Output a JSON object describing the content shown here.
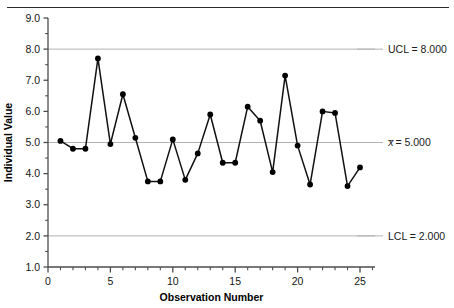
{
  "chart_data": {
    "type": "line",
    "title": "",
    "xlabel": "Observation Number",
    "ylabel": "Individual Value",
    "xlim": [
      0,
      26
    ],
    "ylim": [
      1.0,
      9.0
    ],
    "grid": false,
    "legend": "none",
    "x": [
      1,
      2,
      3,
      4,
      5,
      6,
      7,
      8,
      9,
      10,
      11,
      12,
      13,
      14,
      15,
      16,
      17,
      18,
      19,
      20,
      21,
      22,
      23,
      24,
      25
    ],
    "values": [
      5.05,
      4.8,
      4.8,
      7.7,
      4.95,
      6.55,
      5.15,
      3.75,
      3.75,
      5.1,
      3.8,
      4.65,
      5.9,
      4.35,
      4.35,
      6.15,
      5.7,
      4.05,
      7.15,
      4.9,
      3.65,
      6.0,
      5.95,
      3.6,
      4.2
    ],
    "series": [
      {
        "name": "Individual Value",
        "values": [
          5.05,
          4.8,
          4.8,
          7.7,
          4.95,
          6.55,
          5.15,
          3.75,
          3.75,
          5.1,
          3.8,
          4.65,
          5.9,
          4.35,
          4.35,
          6.15,
          5.7,
          4.05,
          7.15,
          4.9,
          3.65,
          6.0,
          5.95,
          3.6,
          4.2
        ]
      }
    ],
    "y_ticks": [
      1.0,
      2.0,
      3.0,
      4.0,
      5.0,
      6.0,
      7.0,
      8.0,
      9.0
    ],
    "y_tick_labels": [
      "1.0",
      "2.0",
      "3.0",
      "4.0",
      "5.0",
      "6.0",
      "7.0",
      "8.0",
      "9.0"
    ],
    "y_minor_ticks": [
      1.5,
      2.5,
      3.5,
      4.5,
      5.5,
      6.5,
      7.5,
      8.5
    ],
    "x_ticks": [
      0,
      5,
      10,
      15,
      20,
      25
    ],
    "x_tick_labels": [
      "0",
      "5",
      "10",
      "15",
      "20",
      "25"
    ],
    "control_limits": [
      {
        "id": "ucl",
        "label": "UCL = 8.000",
        "value": 8.0
      },
      {
        "id": "center",
        "label_prefix": "x",
        "label_suffix": " = 5.000",
        "label": "x̄ = 5.000",
        "value": 5.0
      },
      {
        "id": "lcl",
        "label": "LCL = 2.000",
        "value": 2.0
      }
    ],
    "colors": {
      "line": "#111111",
      "marker": "#000000",
      "limit_line": "#b3b3b3",
      "axis": "#4d4d4d",
      "background": "#ffffff"
    }
  }
}
